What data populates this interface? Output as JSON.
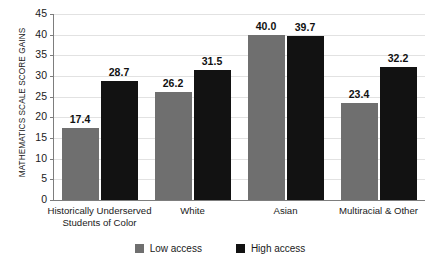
{
  "chart_data": {
    "type": "bar",
    "title": "",
    "xlabel": "",
    "ylabel": "MATHEMATICS SCALE SCORE GAINS",
    "ylim": [
      0,
      45
    ],
    "ytick_step": 5,
    "grid": true,
    "legend_position": "bottom-center",
    "categories": [
      "Historically Underserved Students of Color",
      "White",
      "Asian",
      "Multiracial & Other"
    ],
    "category_lines": [
      [
        "Historically Underserved",
        "Students of Color"
      ],
      [
        "White",
        ""
      ],
      [
        "Asian",
        ""
      ],
      [
        "Multiracial & Other",
        ""
      ]
    ],
    "series": [
      {
        "name": "Low access",
        "color": "#6f6f6f",
        "values": [
          17.4,
          26.2,
          40.0,
          23.4
        ]
      },
      {
        "name": "High access",
        "color": "#121212",
        "values": [
          28.7,
          31.5,
          39.7,
          32.2
        ]
      }
    ],
    "value_labels": [
      [
        "17.4",
        "28.7"
      ],
      [
        "26.2",
        "31.5"
      ],
      [
        "40.0",
        "39.7"
      ],
      [
        "23.4",
        "32.2"
      ]
    ],
    "yticks": [
      "0",
      "5",
      "10",
      "15",
      "20",
      "25",
      "30",
      "35",
      "40",
      "45"
    ]
  },
  "axis": {
    "y_title": "MATHEMATICS SCALE SCORE GAINS"
  },
  "legend": {
    "items": [
      {
        "label": "Low access",
        "color": "#6f6f6f"
      },
      {
        "label": "High access",
        "color": "#121212"
      }
    ]
  },
  "colors": {
    "low_access": "#6f6f6f",
    "high_access": "#121212",
    "grid": "#e2e2e2",
    "axis": "#7d7d7d",
    "text": "#1a1a1a",
    "background": "#ffffff"
  }
}
